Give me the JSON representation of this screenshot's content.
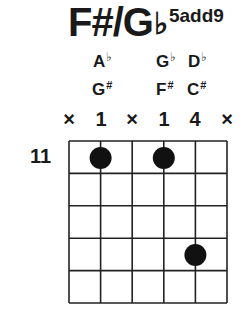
{
  "chord": {
    "root": "F#/G",
    "flat_symbol": "♭",
    "extension": "5add9"
  },
  "note_names": {
    "row1": [
      {
        "string": 2,
        "name": "A",
        "accidental": "♭"
      },
      {
        "string": 4,
        "name": "G",
        "accidental": "♭"
      },
      {
        "string": 5,
        "name": "D",
        "accidental": "♭"
      }
    ],
    "row2": [
      {
        "string": 2,
        "name": "G",
        "accidental": "#"
      },
      {
        "string": 4,
        "name": "F",
        "accidental": "#"
      },
      {
        "string": 5,
        "name": "C",
        "accidental": "#"
      }
    ]
  },
  "string_markers": [
    "×",
    "1",
    "×",
    "1",
    "4",
    "×"
  ],
  "start_fret": "11",
  "diagram": {
    "strings": 6,
    "frets": 5,
    "dots": [
      {
        "string": 2,
        "fret": 1,
        "finger": "1"
      },
      {
        "string": 4,
        "fret": 1,
        "finger": "1"
      },
      {
        "string": 5,
        "fret": 4,
        "finger": "4"
      }
    ],
    "line_color": "#222222",
    "dot_color": "#111111"
  }
}
